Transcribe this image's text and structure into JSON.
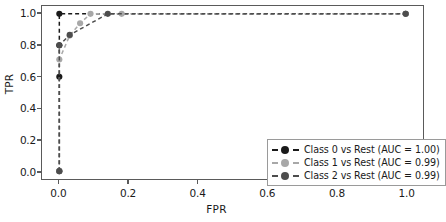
{
  "chart_data": {
    "type": "line",
    "title": "",
    "xlabel": "FPR",
    "ylabel": "TPR",
    "xlim": [
      -0.05,
      1.05
    ],
    "ylim": [
      -0.05,
      1.05
    ],
    "xticks": [
      "0.0",
      "0.2",
      "0.4",
      "0.6",
      "0.8",
      "1.0"
    ],
    "xtick_values": [
      0.0,
      0.2,
      0.4,
      0.6,
      0.8,
      1.0
    ],
    "yticks": [
      "0.0",
      "0.2",
      "0.4",
      "0.6",
      "0.8",
      "1.0"
    ],
    "ytick_values": [
      0.0,
      0.2,
      0.4,
      0.6,
      0.8,
      1.0
    ],
    "grid": false,
    "legend_position": "lower right",
    "linestyle": "dashed",
    "marker": "circle",
    "series": [
      {
        "name": "Class 0 vs Rest (AUC = 1.00)",
        "auc": "1.00",
        "color": "#1a1a1a",
        "x": [
          0.0,
          0.0,
          0.0,
          0.0,
          1.0
        ],
        "y": [
          0.0,
          0.6,
          0.8,
          1.0,
          1.0
        ]
      },
      {
        "name": "Class 1 vs Rest (AUC = 0.99)",
        "auc": "0.99",
        "color": "#a8a8a8",
        "x": [
          0.0,
          0.0,
          0.03,
          0.06,
          0.09,
          0.18,
          1.0
        ],
        "y": [
          0.0,
          0.71,
          0.862,
          0.94,
          1.0,
          1.0,
          1.0
        ]
      },
      {
        "name": "Class 2 vs Rest (AUC = 0.99)",
        "auc": "0.99",
        "color": "#4d4d4d",
        "x": [
          0.0,
          0.0,
          0.03,
          0.14,
          1.0
        ],
        "y": [
          0.0,
          0.8,
          0.866,
          1.0,
          1.0
        ]
      }
    ]
  },
  "axes": {
    "x_title": "FPR",
    "y_title": "TPR"
  },
  "legend": {
    "entries": [
      {
        "label": "Class 0 vs Rest (AUC = 1.00)"
      },
      {
        "label": "Class 1 vs Rest (AUC = 0.99)"
      },
      {
        "label": "Class 2 vs Rest (AUC = 0.99)"
      }
    ]
  },
  "colors": {
    "class0": "#1a1a1a",
    "class1": "#a8a8a8",
    "class2": "#4d4d4d",
    "frame": "#5a5a5a",
    "legend_border": "#9a9a9a",
    "background": "#ffffff"
  }
}
